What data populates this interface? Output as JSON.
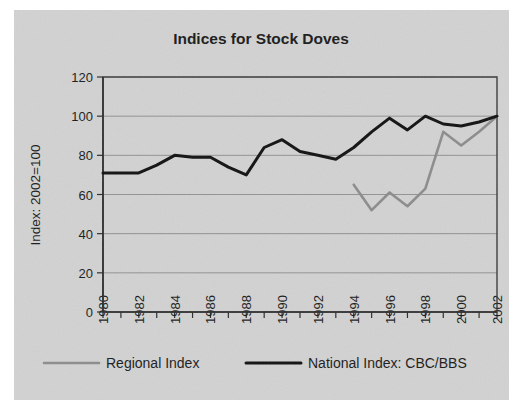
{
  "figure": {
    "background_color": "#ffffff",
    "panel_color": "#d2d2d2"
  },
  "chart_data": {
    "type": "line",
    "title": "Indices for Stock Doves",
    "xlabel": "",
    "ylabel": "Index: 2002=100",
    "xlim": [
      1980,
      2002
    ],
    "ylim": [
      0,
      120
    ],
    "yticks": [
      0,
      20,
      40,
      60,
      80,
      100,
      120
    ],
    "ytick_labels": [
      "0",
      "20",
      "40",
      "60",
      "80",
      "100",
      "120"
    ],
    "xticks": [
      1980,
      1981,
      1982,
      1983,
      1984,
      1985,
      1986,
      1987,
      1988,
      1989,
      1990,
      1991,
      1992,
      1993,
      1994,
      1995,
      1996,
      1997,
      1998,
      1999,
      2000,
      2001,
      2002
    ],
    "xtick_labels": [
      "1980",
      "",
      "1982",
      "",
      "1984",
      "",
      "1986",
      "",
      "1988",
      "",
      "1990",
      "",
      "1992",
      "",
      "1994",
      "",
      "1996",
      "",
      "1998",
      "",
      "2000",
      "",
      "2002"
    ],
    "xtick_labels_shown": [
      "1980",
      "1982",
      "1984",
      "1986",
      "1988",
      "1990",
      "1992",
      "1994",
      "1996",
      "1998",
      "2000",
      "2002"
    ],
    "grid": true,
    "grid_axis": "y",
    "legend_position": "bottom",
    "series": [
      {
        "name": "Regional Index",
        "color": "#8c8c8c",
        "width": 2.6,
        "x": [
          1994,
          1995,
          1996,
          1997,
          1998,
          1999,
          2000,
          2001,
          2002
        ],
        "values": [
          65,
          52,
          61,
          54,
          63,
          92,
          85,
          92,
          100
        ]
      },
      {
        "name": "National Index: CBC/BBS",
        "color": "#111111",
        "width": 3.0,
        "x": [
          1980,
          1981,
          1982,
          1983,
          1984,
          1985,
          1986,
          1987,
          1988,
          1989,
          1990,
          1991,
          1992,
          1993,
          1994,
          1995,
          1996,
          1997,
          1998,
          1999,
          2000,
          2001,
          2002
        ],
        "values": [
          71,
          71,
          71,
          75,
          80,
          79,
          79,
          74,
          70,
          84,
          88,
          82,
          80,
          78,
          84,
          92,
          99,
          93,
          100,
          96,
          95,
          97,
          100
        ]
      }
    ]
  },
  "legend": {
    "entries": [
      {
        "label": "Regional Index",
        "color": "#8c8c8c"
      },
      {
        "label": "National Index: CBC/BBS",
        "color": "#111111"
      }
    ]
  }
}
